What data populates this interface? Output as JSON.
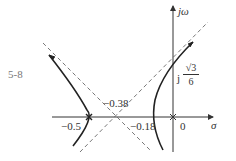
{
  "figure": {
    "label": "5-8"
  },
  "axes": {
    "x_label": "σ",
    "y_label": "jω",
    "origin_label": "0"
  },
  "annotations": {
    "centroid": "−0.38",
    "breakaway_left": "−0.5",
    "breakaway_right": "−0.18",
    "imag_crossing_prefix": "j",
    "imag_crossing_num": "√3",
    "imag_crossing_den": "6"
  },
  "colors": {
    "curve": "#222222",
    "axis": "#333333",
    "asymptote": "#555555"
  }
}
